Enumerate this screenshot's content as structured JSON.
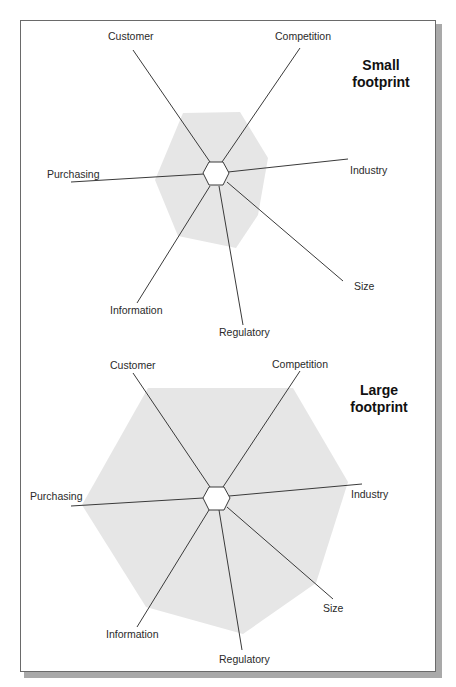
{
  "colors": {
    "fill": "#e6e6e6",
    "axis": "#3a3a3a",
    "frame": "#6a6a6a",
    "shadow": "#a9a9a9"
  },
  "diagrams": [
    {
      "title_line1": "Small",
      "title_line2": "footprint",
      "axes": {
        "customer": "Customer",
        "competition": "Competition",
        "industry": "Industry",
        "size": "Size",
        "regulatory": "Regulatory",
        "information": "Information",
        "purchasing": "Purchasing"
      }
    },
    {
      "title_line1": "Large",
      "title_line2": "footprint",
      "axes": {
        "customer": "Customer",
        "competition": "Competition",
        "industry": "Industry",
        "size": "Size",
        "regulatory": "Regulatory",
        "information": "Information",
        "purchasing": "Purchasing"
      }
    }
  ]
}
